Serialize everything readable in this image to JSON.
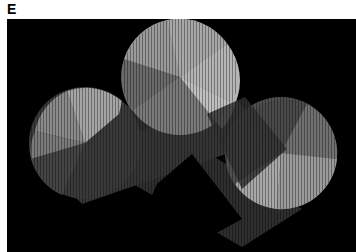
{
  "figure": {
    "panel_label": "E",
    "image": {
      "description": "Grayscale micrograph: three circular fan-shaped pads (top-center, lower-left, lower-right) connected by two crossing dark rectangular bands, on a black background",
      "background_color": "#000000",
      "shapes": [
        {
          "name": "top-circle",
          "cx": 180,
          "cy": 70,
          "r": 58
        },
        {
          "name": "left-circle",
          "cx": 85,
          "cy": 143,
          "r": 57
        },
        {
          "name": "right-circle",
          "cx": 281,
          "cy": 152,
          "r": 57
        }
      ]
    }
  }
}
